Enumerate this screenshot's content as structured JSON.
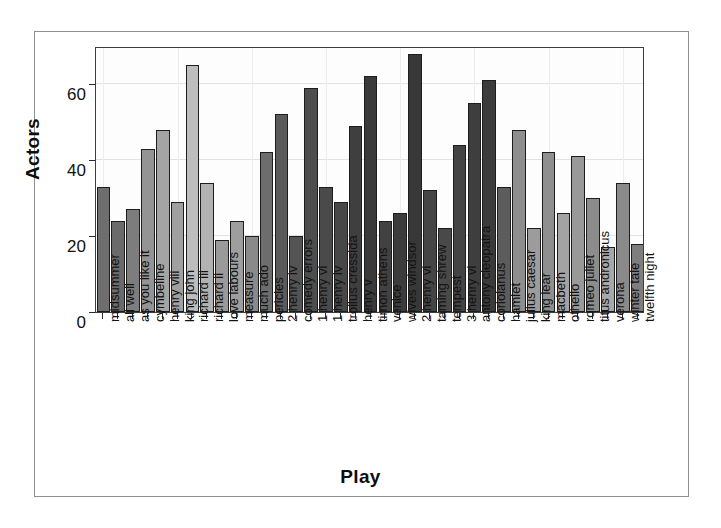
{
  "chart_data": {
    "type": "bar",
    "title": "",
    "xlabel": "Play",
    "ylabel": "Actors",
    "ylim": [
      0,
      70
    ],
    "yticks": [
      0,
      20,
      40,
      60
    ],
    "ytick_labels": [
      "0",
      "20",
      "40",
      "60"
    ],
    "grid": true,
    "legend": "none",
    "categories": [
      "midsummer",
      "all well",
      "as you like it",
      "cymbeline",
      "henry viii",
      "king john",
      "richard iii",
      "richard ii",
      "love labours",
      "measure",
      "much ado",
      "pericles",
      "2 henry iv",
      "comedy errors",
      "1 henry vi",
      "1 henry iv",
      "troilus cressida",
      "henry v",
      "timon athens",
      "venice",
      "wives windsor",
      "2 henry vi",
      "taming shrew",
      "tempest",
      "3 henry vi",
      "antony cleopatra",
      "coriolanus",
      "hamlet",
      "julius caesar",
      "king lear",
      "macbeth",
      "othello",
      "romeo juliet",
      "titus andronicus",
      "verona",
      "winter tale",
      "twelfth night"
    ],
    "values": [
      33,
      24,
      27,
      43,
      48,
      29,
      65,
      34,
      19,
      24,
      20,
      42,
      52,
      20,
      59,
      33,
      29,
      49,
      62,
      24,
      26,
      68,
      32,
      22,
      44,
      55,
      61,
      33,
      48,
      22,
      42,
      26,
      41,
      30,
      17,
      34,
      18
    ],
    "bar_shades": [
      "#6e6e6e",
      "#6a6a6a",
      "#7d7d7d",
      "#949494",
      "#a4a4a4",
      "#a0a0a0",
      "#bdbdbd",
      "#b2b2b2",
      "#9a9a9a",
      "#9e9e9e",
      "#8a8a8a",
      "#6d6d6d",
      "#5a5a5a",
      "#545454",
      "#4d4d4d",
      "#4a4a4a",
      "#474747",
      "#3f3f3f",
      "#3a3a3a",
      "#414141",
      "#3c3c3c",
      "#383838",
      "#454545",
      "#494949",
      "#444444",
      "#3e3e3e",
      "#3b3b3b",
      "#5c5c5c",
      "#8e8e8e",
      "#9c9c9c",
      "#8f8f8f",
      "#a3a3a3",
      "#999999",
      "#8c8c8c",
      "#a8a8a8",
      "#8a8a8a",
      "#7e7e7e"
    ]
  },
  "axis": {
    "y_title": "Actors",
    "x_title": "Play"
  }
}
